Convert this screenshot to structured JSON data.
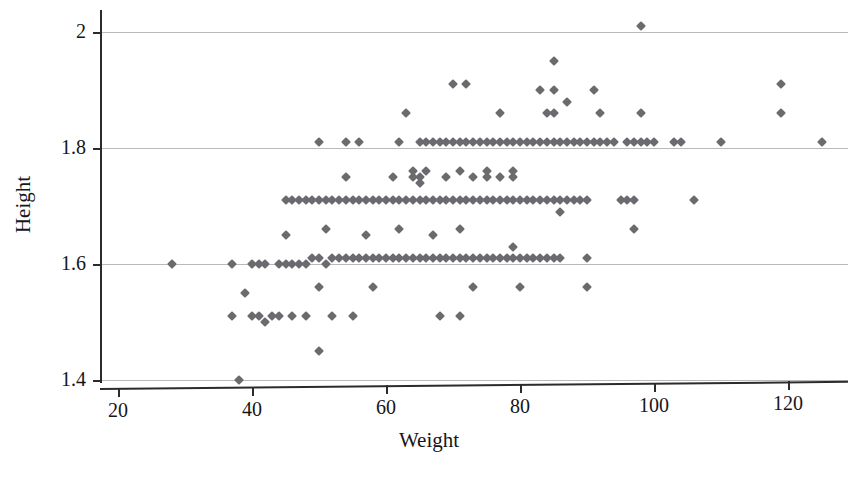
{
  "chart_data": {
    "type": "scatter",
    "title": "",
    "xlabel": "Weight",
    "ylabel": "Height",
    "xlim": [
      13,
      131
    ],
    "ylim": [
      1.378,
      2.022
    ],
    "xticks": [
      20,
      40,
      60,
      80,
      100,
      120
    ],
    "xticklabels": [
      "20",
      "40",
      "60",
      "80",
      "100",
      "120"
    ],
    "yticks": [
      1.4,
      1.6,
      1.8,
      2.0
    ],
    "yticklabels": [
      "1.4",
      "1.6",
      "1.8",
      "2"
    ],
    "grid": "horizontal",
    "legend": "none",
    "marker": "diamond",
    "marker_color": "#6b6b6f",
    "marker_size_px": 7,
    "axis_color": "#2b2b2b",
    "gridline_color": "#b9b9b9",
    "background": "#ffffff",
    "n_points": 201,
    "points": [
      [
        28,
        1.6
      ],
      [
        37,
        1.6
      ],
      [
        37,
        1.51
      ],
      [
        38,
        1.4
      ],
      [
        39,
        1.55
      ],
      [
        40,
        1.51
      ],
      [
        40,
        1.6
      ],
      [
        41,
        1.51
      ],
      [
        41,
        1.6
      ],
      [
        42,
        1.6
      ],
      [
        42,
        1.5
      ],
      [
        43,
        1.51
      ],
      [
        44,
        1.6
      ],
      [
        44,
        1.51
      ],
      [
        45,
        1.6
      ],
      [
        45,
        1.71
      ],
      [
        45,
        1.65
      ],
      [
        46,
        1.6
      ],
      [
        46,
        1.71
      ],
      [
        46,
        1.51
      ],
      [
        47,
        1.6
      ],
      [
        47,
        1.71
      ],
      [
        48,
        1.6
      ],
      [
        48,
        1.71
      ],
      [
        48,
        1.51
      ],
      [
        49,
        1.71
      ],
      [
        49,
        1.61
      ],
      [
        50,
        1.81
      ],
      [
        50,
        1.71
      ],
      [
        50,
        1.61
      ],
      [
        50,
        1.56
      ],
      [
        50,
        1.45
      ],
      [
        51,
        1.71
      ],
      [
        51,
        1.66
      ],
      [
        51,
        1.6
      ],
      [
        52,
        1.71
      ],
      [
        52,
        1.61
      ],
      [
        52,
        1.51
      ],
      [
        53,
        1.71
      ],
      [
        53,
        1.61
      ],
      [
        54,
        1.81
      ],
      [
        54,
        1.75
      ],
      [
        54,
        1.71
      ],
      [
        54,
        1.61
      ],
      [
        55,
        1.71
      ],
      [
        55,
        1.61
      ],
      [
        55,
        1.51
      ],
      [
        56,
        1.81
      ],
      [
        56,
        1.71
      ],
      [
        56,
        1.61
      ],
      [
        57,
        1.71
      ],
      [
        57,
        1.65
      ],
      [
        57,
        1.61
      ],
      [
        58,
        1.71
      ],
      [
        58,
        1.61
      ],
      [
        58,
        1.56
      ],
      [
        59,
        1.71
      ],
      [
        59,
        1.61
      ],
      [
        60,
        1.71
      ],
      [
        60,
        1.61
      ],
      [
        61,
        1.75
      ],
      [
        61,
        1.71
      ],
      [
        61,
        1.61
      ],
      [
        62,
        1.81
      ],
      [
        62,
        1.71
      ],
      [
        62,
        1.66
      ],
      [
        62,
        1.61
      ],
      [
        63,
        1.86
      ],
      [
        63,
        1.71
      ],
      [
        63,
        1.61
      ],
      [
        64,
        1.76
      ],
      [
        64,
        1.75
      ],
      [
        64,
        1.71
      ],
      [
        64,
        1.61
      ],
      [
        65,
        1.81
      ],
      [
        65,
        1.75
      ],
      [
        65,
        1.74
      ],
      [
        65,
        1.71
      ],
      [
        65,
        1.61
      ],
      [
        66,
        1.81
      ],
      [
        66,
        1.76
      ],
      [
        66,
        1.71
      ],
      [
        66,
        1.61
      ],
      [
        67,
        1.81
      ],
      [
        67,
        1.71
      ],
      [
        67,
        1.65
      ],
      [
        67,
        1.61
      ],
      [
        68,
        1.81
      ],
      [
        68,
        1.71
      ],
      [
        68,
        1.61
      ],
      [
        68,
        1.51
      ],
      [
        69,
        1.81
      ],
      [
        69,
        1.75
      ],
      [
        69,
        1.71
      ],
      [
        69,
        1.61
      ],
      [
        70,
        1.91
      ],
      [
        70,
        1.81
      ],
      [
        70,
        1.71
      ],
      [
        70,
        1.61
      ],
      [
        71,
        1.81
      ],
      [
        71,
        1.76
      ],
      [
        71,
        1.71
      ],
      [
        71,
        1.66
      ],
      [
        71,
        1.61
      ],
      [
        71,
        1.51
      ],
      [
        72,
        1.91
      ],
      [
        72,
        1.81
      ],
      [
        72,
        1.71
      ],
      [
        72,
        1.61
      ],
      [
        73,
        1.81
      ],
      [
        73,
        1.75
      ],
      [
        73,
        1.71
      ],
      [
        73,
        1.61
      ],
      [
        73,
        1.56
      ],
      [
        74,
        1.81
      ],
      [
        74,
        1.71
      ],
      [
        74,
        1.61
      ],
      [
        75,
        1.81
      ],
      [
        75,
        1.76
      ],
      [
        75,
        1.75
      ],
      [
        75,
        1.71
      ],
      [
        75,
        1.61
      ],
      [
        76,
        1.81
      ],
      [
        76,
        1.71
      ],
      [
        76,
        1.61
      ],
      [
        77,
        1.86
      ],
      [
        77,
        1.81
      ],
      [
        77,
        1.75
      ],
      [
        77,
        1.71
      ],
      [
        77,
        1.61
      ],
      [
        78,
        1.81
      ],
      [
        78,
        1.71
      ],
      [
        78,
        1.61
      ],
      [
        79,
        1.81
      ],
      [
        79,
        1.76
      ],
      [
        79,
        1.75
      ],
      [
        79,
        1.71
      ],
      [
        79,
        1.63
      ],
      [
        79,
        1.61
      ],
      [
        80,
        1.81
      ],
      [
        80,
        1.71
      ],
      [
        80,
        1.61
      ],
      [
        80,
        1.56
      ],
      [
        81,
        1.81
      ],
      [
        81,
        1.71
      ],
      [
        81,
        1.61
      ],
      [
        82,
        1.81
      ],
      [
        82,
        1.71
      ],
      [
        82,
        1.61
      ],
      [
        83,
        1.9
      ],
      [
        83,
        1.81
      ],
      [
        83,
        1.71
      ],
      [
        83,
        1.61
      ],
      [
        84,
        1.86
      ],
      [
        84,
        1.81
      ],
      [
        84,
        1.71
      ],
      [
        84,
        1.61
      ],
      [
        85,
        1.95
      ],
      [
        85,
        1.9
      ],
      [
        85,
        1.86
      ],
      [
        85,
        1.81
      ],
      [
        85,
        1.71
      ],
      [
        85,
        1.61
      ],
      [
        86,
        1.81
      ],
      [
        86,
        1.71
      ],
      [
        86,
        1.69
      ],
      [
        86,
        1.61
      ],
      [
        87,
        1.88
      ],
      [
        87,
        1.81
      ],
      [
        87,
        1.71
      ],
      [
        88,
        1.81
      ],
      [
        88,
        1.71
      ],
      [
        89,
        1.81
      ],
      [
        89,
        1.71
      ],
      [
        90,
        1.81
      ],
      [
        90,
        1.71
      ],
      [
        90,
        1.61
      ],
      [
        90,
        1.56
      ],
      [
        91,
        1.9
      ],
      [
        91,
        1.81
      ],
      [
        92,
        1.86
      ],
      [
        92,
        1.81
      ],
      [
        93,
        1.81
      ],
      [
        94,
        1.81
      ],
      [
        95,
        1.71
      ],
      [
        96,
        1.71
      ],
      [
        96,
        1.81
      ],
      [
        97,
        1.71
      ],
      [
        97,
        1.66
      ],
      [
        97,
        1.81
      ],
      [
        98,
        2.01
      ],
      [
        98,
        1.86
      ],
      [
        98,
        1.81
      ],
      [
        99,
        1.81
      ],
      [
        100,
        1.81
      ],
      [
        103,
        1.81
      ],
      [
        104,
        1.81
      ],
      [
        106,
        1.71
      ],
      [
        110,
        1.81
      ],
      [
        119,
        1.91
      ],
      [
        119,
        1.86
      ],
      [
        125,
        1.81
      ]
    ]
  }
}
